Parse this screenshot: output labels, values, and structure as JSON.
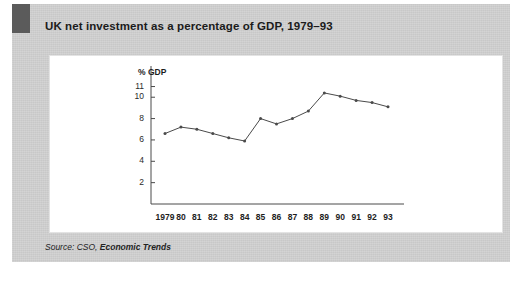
{
  "figure": {
    "title": "UK net investment as a percentage of GDP, 1979–93",
    "source_prefix": "Source: CSO, ",
    "source_publication": "Economic Trends",
    "accent_block_color": "#5b5b5b",
    "panel_color": "#cfcfcf",
    "card_color": "#ffffff",
    "line_color": "#4a4a4a"
  },
  "chart_data": {
    "type": "line",
    "title": "UK net investment as a percentage of GDP, 1979–93",
    "xlabel": "",
    "ylabel": "% GDP",
    "categories": [
      "1979",
      "80",
      "81",
      "82",
      "83",
      "84",
      "85",
      "86",
      "87",
      "88",
      "89",
      "90",
      "91",
      "92",
      "93"
    ],
    "values": [
      6.6,
      7.2,
      7.0,
      6.6,
      6.2,
      5.9,
      8.0,
      7.5,
      8.0,
      8.7,
      10.4,
      10.1,
      9.7,
      9.5,
      9.1
    ],
    "series": [
      {
        "name": "UK net investment (% of GDP)",
        "values": [
          6.6,
          7.2,
          7.0,
          6.6,
          6.2,
          5.9,
          8.0,
          7.5,
          8.0,
          8.7,
          10.4,
          10.1,
          9.7,
          9.5,
          9.1
        ]
      }
    ],
    "ylim": [
      0,
      11.8
    ],
    "ytick_labels": [
      "11",
      "10",
      "8",
      "6",
      "4",
      "2"
    ],
    "ytick_values": [
      11,
      10,
      8,
      6,
      4,
      2
    ],
    "xtick_labels": [
      "1979",
      "80",
      "81",
      "82",
      "83",
      "84",
      "85",
      "86",
      "87",
      "88",
      "89",
      "90",
      "91",
      "92",
      "93"
    ],
    "grid": false,
    "legend": "none",
    "markers": true
  }
}
